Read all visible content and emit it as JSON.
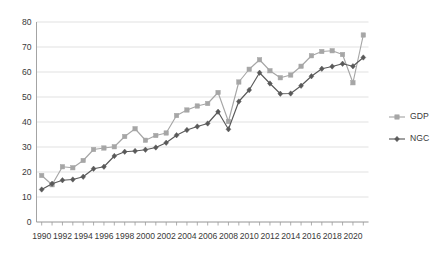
{
  "chart_data": {
    "type": "line",
    "title": "",
    "subtitle": "",
    "xlabel": "",
    "ylabel": "",
    "xlim": [
      1989.5,
      2021.5
    ],
    "ylim": [
      0,
      80
    ],
    "ytick_step": 10,
    "yticks": [
      0,
      10,
      20,
      30,
      40,
      50,
      60,
      70,
      80
    ],
    "xticks_labeled": [
      1990,
      1992,
      1994,
      1996,
      1998,
      2000,
      2002,
      2004,
      2006,
      2008,
      2010,
      2012,
      2014,
      2016,
      2018,
      2020
    ],
    "grid": "horizontal",
    "legend_position": "right",
    "x": [
      1990,
      1991,
      1992,
      1993,
      1994,
      1995,
      1996,
      1997,
      1998,
      1999,
      2000,
      2001,
      2002,
      2003,
      2004,
      2005,
      2006,
      2007,
      2008,
      2009,
      2010,
      2011,
      2012,
      2013,
      2014,
      2015,
      2016,
      2017,
      2018,
      2019,
      2020,
      2021
    ],
    "series": [
      {
        "name": "GDP",
        "color": "#a6a6a6",
        "marker": "square",
        "values": [
          18.6,
          14.9,
          22.1,
          21.7,
          24.6,
          29.0,
          29.6,
          30.1,
          34.2,
          37.3,
          32.7,
          34.6,
          35.6,
          42.6,
          44.8,
          46.4,
          47.4,
          51.8,
          40.2,
          56.0,
          61.1,
          64.9,
          60.5,
          57.7,
          58.8,
          62.3,
          66.5,
          68.2,
          68.5,
          67.0,
          55.7,
          74.8
        ]
      },
      {
        "name": "NGC",
        "color": "#595959",
        "marker": "diamond",
        "values": [
          13.0,
          15.3,
          16.7,
          17.0,
          18.1,
          21.3,
          22.1,
          26.4,
          28.1,
          28.4,
          28.9,
          29.8,
          31.7,
          34.7,
          36.8,
          38.2,
          39.4,
          44.1,
          37.1,
          48.2,
          52.8,
          59.7,
          55.4,
          51.3,
          51.4,
          54.5,
          58.3,
          61.3,
          62.2,
          63.3,
          62.3,
          65.8
        ]
      }
    ]
  },
  "legend": {
    "items": [
      {
        "label": "GDP"
      },
      {
        "label": "NGC"
      }
    ]
  }
}
